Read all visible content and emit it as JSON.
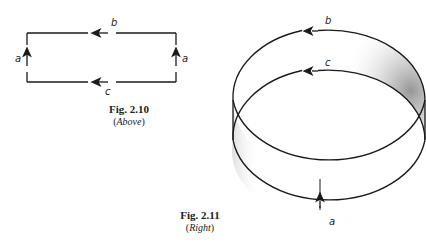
{
  "figures": [
    {
      "id": "fig-2-10",
      "caption_title": "Fig. 2.10",
      "caption_sub_open": "(",
      "caption_sub": "Above",
      "caption_sub_close": ")",
      "labels": {
        "top": "b",
        "bottom": "c",
        "left": "a",
        "right": "a"
      }
    },
    {
      "id": "fig-2-11",
      "caption_title": "Fig. 2.11",
      "caption_sub_open": "(",
      "caption_sub": "Right",
      "caption_sub_close": ")",
      "labels": {
        "top": "b",
        "middle": "c",
        "bottom": "a"
      }
    }
  ],
  "colors": {
    "ink": "#1a1a1a",
    "shade": "#9a9a9a"
  }
}
